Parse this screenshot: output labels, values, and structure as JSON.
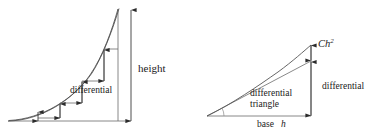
{
  "figure": {
    "background_color": "#ffffff",
    "ink_color": "#3a3a3a",
    "curve_color": "#555555",
    "rule_color": "#6b6b6b",
    "panels": [
      {
        "id": "left-panel",
        "name": "staircase-approximation-panel",
        "labels": {
          "height": "height",
          "differential": "differential"
        },
        "geometry": {
          "baseline_y": 121,
          "origin_x": 8,
          "axis_x": 118,
          "curve_top_y": 9,
          "measure_arrow_x": 131,
          "step_count": 4
        }
      },
      {
        "id": "right-panel",
        "name": "differential-triangle-panel",
        "labels": {
          "error_term": "Ch",
          "error_exponent": "2",
          "differential": "differential",
          "triangle_line1": "differential",
          "triangle_line2": "triangle",
          "base_word": "base",
          "base_var": "h"
        },
        "geometry": {
          "baseline_y": 116,
          "apex_x": 207,
          "vertical_x": 311,
          "curve_top_y": 45,
          "tangent_top_y": 61,
          "measure_arrow_x": 311
        }
      }
    ]
  }
}
